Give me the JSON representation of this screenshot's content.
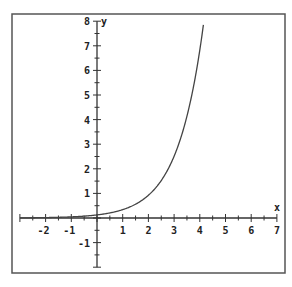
{
  "chart_data": {
    "type": "line",
    "title": "",
    "xlabel": "x",
    "ylabel": "y",
    "xlim": [
      -3,
      7
    ],
    "ylim": [
      -2,
      8
    ],
    "x_ticks": [
      -2,
      -1,
      1,
      2,
      3,
      4,
      5,
      6,
      7
    ],
    "y_ticks": [
      -1,
      1,
      2,
      3,
      4,
      5,
      6,
      7,
      8
    ],
    "grid": false,
    "legend": null,
    "series": [
      {
        "name": "exponential curve",
        "function": "y = e^x / 8",
        "x": [
          -3,
          -2,
          -1,
          0,
          1,
          2,
          3,
          3.5,
          4,
          4.15
        ],
        "y": [
          0.006,
          0.017,
          0.046,
          0.125,
          0.34,
          0.92,
          2.51,
          4.14,
          6.82,
          7.93
        ]
      }
    ]
  }
}
